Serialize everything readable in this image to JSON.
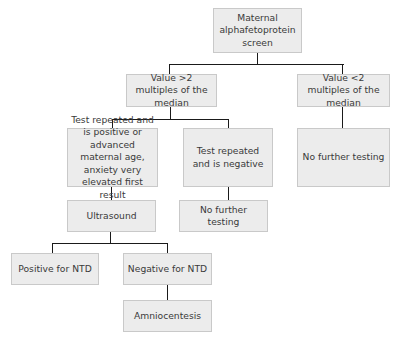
{
  "diagram": {
    "type": "flowchart",
    "nodes": {
      "root": "Maternal alphafetoprotein screen",
      "high": "Value >2 multiples of the median",
      "low": "Value <2 multiples of the median",
      "repeat_positive": "Test repeated and is positive or advanced maternal age, anxiety very elevated first result",
      "repeat_negative": "Test repeated and is negative",
      "low_no_further": "No further testing",
      "ultrasound": "Ultrasound",
      "negative_no_further": "No further testing",
      "positive_ntd": "Positive for NTD",
      "negative_ntd": "Negative for NTD",
      "amniocentesis": "Amniocentesis"
    },
    "edges": [
      [
        "root",
        "high"
      ],
      [
        "root",
        "low"
      ],
      [
        "high",
        "repeat_positive"
      ],
      [
        "high",
        "repeat_negative"
      ],
      [
        "low",
        "low_no_further"
      ],
      [
        "repeat_positive",
        "ultrasound"
      ],
      [
        "repeat_negative",
        "negative_no_further"
      ],
      [
        "ultrasound",
        "positive_ntd"
      ],
      [
        "ultrasound",
        "negative_ntd"
      ],
      [
        "negative_ntd",
        "amniocentesis"
      ]
    ],
    "colors": {
      "box_fill": "#ececec",
      "box_border": "#c9c9c9",
      "line": "#1a1a1a",
      "text": "#3a3a3a"
    }
  }
}
